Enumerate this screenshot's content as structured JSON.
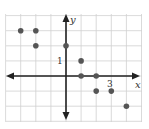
{
  "chart_data": {
    "type": "scatter",
    "title": "",
    "xlabel": "x",
    "ylabel": "y",
    "tick_labels": {
      "x": [
        "3"
      ],
      "y": [
        "1"
      ]
    },
    "xlim": [
      -4,
      5
    ],
    "ylim": [
      -3,
      4
    ],
    "grid": true,
    "legend": null,
    "points": [
      {
        "x": -3,
        "y": 3
      },
      {
        "x": -2,
        "y": 3
      },
      {
        "x": -2,
        "y": 2
      },
      {
        "x": 0,
        "y": 2
      },
      {
        "x": 1,
        "y": 1
      },
      {
        "x": 1,
        "y": 0
      },
      {
        "x": 2,
        "y": 0
      },
      {
        "x": 2,
        "y": -1
      },
      {
        "x": 3,
        "y": -1
      },
      {
        "x": 4,
        "y": -2
      }
    ]
  },
  "labels": {
    "x_axis": "x",
    "y_axis": "y",
    "x_tick": "3",
    "y_tick": "1"
  },
  "colors": {
    "grid": "#d0d0d0",
    "axis": "#222222",
    "point": "#555555"
  }
}
